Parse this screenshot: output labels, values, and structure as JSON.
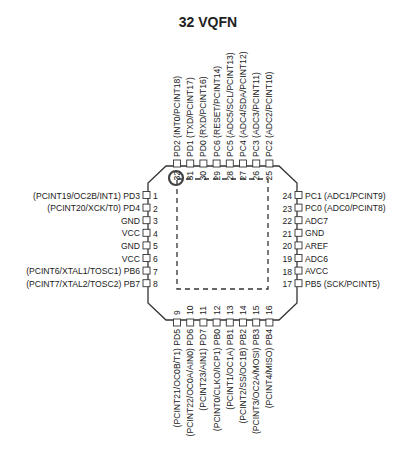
{
  "title": "32 VQFN",
  "package": {
    "pin1_marker": "circle",
    "exposed_pad": "dashed-square"
  },
  "pins": {
    "left": [
      {
        "num": "1",
        "name": "PD3",
        "alt": "(PCINT19/OC2B/INT1)"
      },
      {
        "num": "2",
        "name": "PD4",
        "alt": "(PCINT20/XCK/T0)"
      },
      {
        "num": "3",
        "name": "GND",
        "alt": ""
      },
      {
        "num": "4",
        "name": "VCC",
        "alt": ""
      },
      {
        "num": "5",
        "name": "GND",
        "alt": ""
      },
      {
        "num": "6",
        "name": "VCC",
        "alt": ""
      },
      {
        "num": "7",
        "name": "PB6",
        "alt": "(PCINT6/XTAL1/TOSC1)"
      },
      {
        "num": "8",
        "name": "PB7",
        "alt": "(PCINT7/XTAL2/TOSC2)"
      }
    ],
    "bottom": [
      {
        "num": "9",
        "name": "PD5",
        "alt": "(PCINT21/OC0B/T1)"
      },
      {
        "num": "10",
        "name": "PD6",
        "alt": "(PCINT22/OC0A/AIN0)"
      },
      {
        "num": "11",
        "name": "PD7",
        "alt": "(PCINT23/AIN1)"
      },
      {
        "num": "12",
        "name": "PB0",
        "alt": "(PCINT0/CLKO/ICP1)"
      },
      {
        "num": "13",
        "name": "PB1",
        "alt": "(PCINT1/OC1A)"
      },
      {
        "num": "14",
        "name": "PB2",
        "alt": "(PCINT2/SS/OC1B)"
      },
      {
        "num": "15",
        "name": "PB3",
        "alt": "(PCINT3/OC2A/MOSI)"
      },
      {
        "num": "16",
        "name": "PB4",
        "alt": "(PCINT4/MISO)"
      }
    ],
    "right": [
      {
        "num": "17",
        "name": "PB5",
        "alt": "(SCK/PCINT5)"
      },
      {
        "num": "18",
        "name": "AVCC",
        "alt": ""
      },
      {
        "num": "19",
        "name": "ADC6",
        "alt": ""
      },
      {
        "num": "20",
        "name": "AREF",
        "alt": ""
      },
      {
        "num": "21",
        "name": "GND",
        "alt": ""
      },
      {
        "num": "22",
        "name": "ADC7",
        "alt": ""
      },
      {
        "num": "23",
        "name": "PC0",
        "alt": "(ADC0/PCINT8)"
      },
      {
        "num": "24",
        "name": "PC1",
        "alt": "(ADC1/PCINT9)"
      }
    ],
    "top": [
      {
        "num": "25",
        "name": "PC2",
        "alt": "(ADC2/PCINT10)"
      },
      {
        "num": "26",
        "name": "PC3",
        "alt": "(ADC3/PCINT11)"
      },
      {
        "num": "27",
        "name": "PC4",
        "alt": "(ADC4/SDA/PCINT12)"
      },
      {
        "num": "28",
        "name": "PC5",
        "alt": "(ADC5/SCL/PCINT13)"
      },
      {
        "num": "29",
        "name": "PC6",
        "alt": "(RESET/PCINT14)"
      },
      {
        "num": "30",
        "name": "PD0",
        "alt": "(RXD/PCINT16)"
      },
      {
        "num": "31",
        "name": "PD1",
        "alt": "(TXD/PCINT17)"
      },
      {
        "num": "32",
        "name": "PD2",
        "alt": "(INT0/PCINT18)"
      }
    ]
  }
}
